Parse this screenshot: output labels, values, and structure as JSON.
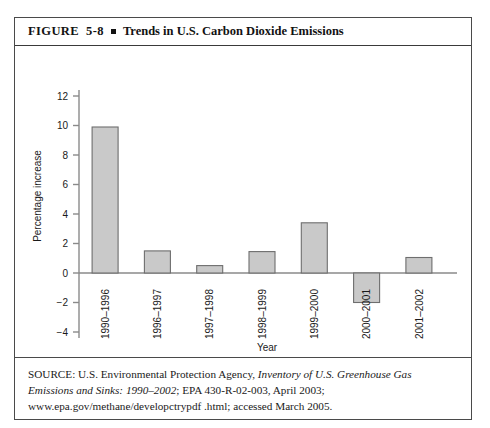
{
  "figure": {
    "label": "FIGURE  5-8",
    "separator_icon": "filled-square-bullet",
    "title": "Trends in U.S. Carbon Dioxide Emissions"
  },
  "source": {
    "prefix": "SOURCE: U.S. Environmental Protection Agency, ",
    "italic_1": "Inventory of U.S. Greenhouse Gas Emissions and Sinks: 1990–2002",
    "middle": "; EPA 430-R-02-003, April 2003; www.epa.gov/methane/developctrypdf .html; accessed March 2005."
  },
  "chart_data": {
    "type": "bar",
    "title": "Trends in U.S. Carbon Dioxide Emissions",
    "categories": [
      "1990–1996",
      "1996–1997",
      "1997–1998",
      "1998–1999",
      "1999–2000",
      "2000–2001",
      "2001–2002"
    ],
    "values": [
      9.9,
      1.5,
      0.5,
      1.45,
      3.4,
      -2.0,
      1.05
    ],
    "xlabel": "Year",
    "ylabel": "Percentage increase",
    "ylim": [
      -4,
      12
    ],
    "yticks": [
      -4,
      -2,
      0,
      2,
      4,
      6,
      8,
      10,
      12
    ],
    "ytick_labels": [
      "−4",
      "−2",
      "0",
      "2",
      "4",
      "6",
      "8",
      "10",
      "12"
    ],
    "grid": false,
    "legend": "none",
    "bar_fill": "#c9c9c9",
    "bar_stroke": "#6e6e6e",
    "axis_color": "#8a8a8a",
    "zero_line": 0
  }
}
